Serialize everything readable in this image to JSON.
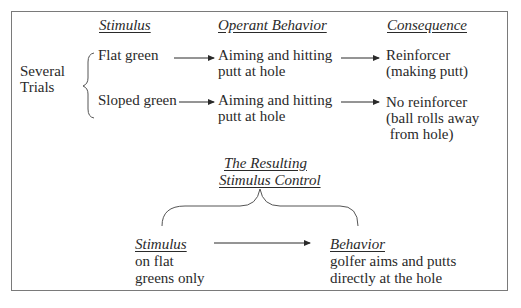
{
  "headers": {
    "stimulus": "Stimulus",
    "operant_behavior": "Operant Behavior",
    "consequence": "Consequence"
  },
  "trials_label": [
    "Several",
    "Trials"
  ],
  "rows": [
    {
      "stimulus": "Flat green",
      "behavior": [
        "Aiming and hitting",
        "putt at hole"
      ],
      "consequence": [
        "Reinforcer",
        "(making putt)"
      ]
    },
    {
      "stimulus": "Sloped green",
      "behavior": [
        "Aiming and hitting",
        "putt at hole"
      ],
      "consequence": [
        "No reinforcer",
        "(ball rolls away",
        " from hole)"
      ]
    }
  ],
  "result": {
    "title": [
      "The Resulting",
      "Stimulus Control"
    ],
    "stimulus": {
      "header": "Stimulus",
      "lines": [
        "on flat",
        "greens only"
      ]
    },
    "behavior": {
      "header": "Behavior",
      "lines": [
        "golfer aims and putts",
        "directly at the hole"
      ]
    }
  },
  "colors": {
    "text": "#2a2a2a",
    "border": "#7a7a7a"
  }
}
